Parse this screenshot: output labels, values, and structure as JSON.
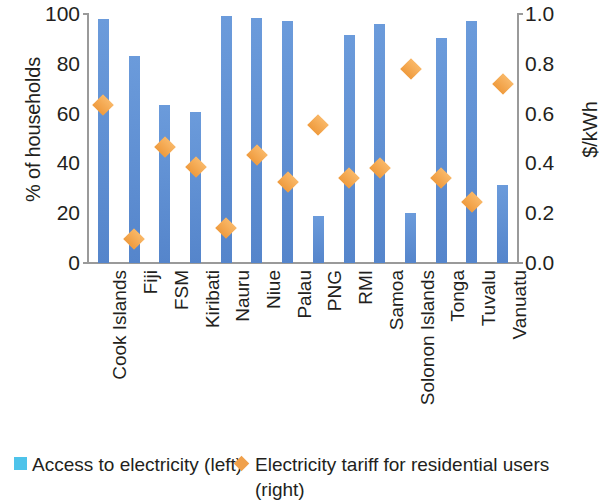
{
  "chart_data": {
    "type": "bar",
    "title": "",
    "subtitle": "",
    "xlabel": "",
    "ylabel": "% of households",
    "y2label": "$/kWh",
    "grid": false,
    "legend_position": "bottom",
    "ylim": [
      0,
      100
    ],
    "y2lim": [
      0.0,
      1.0
    ],
    "yticks": [
      "0",
      "20",
      "40",
      "60",
      "80",
      "100"
    ],
    "ytick_values": [
      0,
      20,
      40,
      60,
      80,
      100
    ],
    "y2ticks": [
      "0.0",
      "0.2",
      "0.4",
      "0.6",
      "0.8",
      "1.0"
    ],
    "y2tick_values": [
      0.0,
      0.2,
      0.4,
      0.6,
      0.8,
      1.0
    ],
    "categories": [
      "Cook Islands",
      "Fiji",
      "FSM",
      "Kiribati",
      "Nauru",
      "Niue",
      "Palau",
      "PNG",
      "RMI",
      "Samoa",
      "Solonon Islands",
      "Tonga",
      "Tuvalu",
      "Vanuatu"
    ],
    "series": [
      {
        "name": "Access to electricity (left)",
        "type": "bar",
        "axis": "left",
        "color": "#5b8fd4",
        "values": [
          98,
          83,
          63.5,
          60.5,
          99,
          98.5,
          97,
          19,
          91.5,
          96,
          20,
          90.5,
          97,
          31.5
        ]
      },
      {
        "name": "Electricity tariff for residential users (right)",
        "type": "scatter",
        "axis": "right",
        "color": "#f0a04b",
        "marker": "diamond",
        "values": [
          0.635,
          0.095,
          0.465,
          0.385,
          0.14,
          0.435,
          0.325,
          0.555,
          0.34,
          0.38,
          0.78,
          0.34,
          0.245,
          0.72
        ]
      }
    ]
  },
  "legend": {
    "bars_label": "Access to electricity (left)",
    "diamonds_label": "Electricity tariff for residential users (right)",
    "bars_swatch_icon": "square-swatch-icon",
    "diamonds_swatch_icon": "diamond-swatch-icon",
    "bars_swatch_color": "#4ec3ea",
    "diamonds_swatch_color": "#f0a04b"
  },
  "axes": {
    "left_title": "% of households",
    "right_title": "$/kWh"
  }
}
